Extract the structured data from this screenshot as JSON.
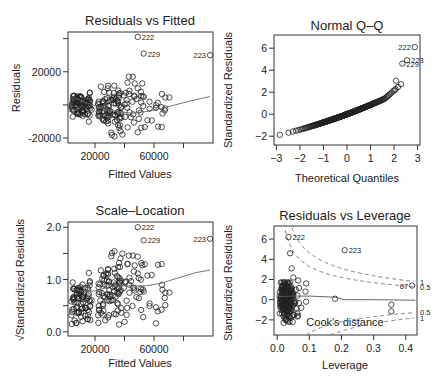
{
  "figure": {
    "caption_fragment": "Figure 6.21: Diagnostic..."
  },
  "chart_data": [
    {
      "id": "p1",
      "type": "scatter",
      "title": "Residuals vs Fitted",
      "xlabel": "Fitted Values",
      "ylabel": "Residuals",
      "xlim": [
        1700,
        100000
      ],
      "ylim": [
        -23000,
        44000
      ],
      "xticks": [
        20000,
        40000,
        60000,
        80000
      ],
      "xtick_labels": [
        "20000",
        "",
        "60000",
        ""
      ],
      "yticks": [
        -20000,
        0,
        20000,
        40000
      ],
      "ytick_labels": [
        "-20000",
        "",
        "20000",
        ""
      ],
      "box": [
        68,
        32,
        213,
        143
      ],
      "labeled_points": [
        {
          "label": "222",
          "x": 49000,
          "y": 41000
        },
        {
          "label": "229",
          "x": 53000,
          "y": 31000
        },
        {
          "label": "223",
          "x": 98000,
          "y": 30000
        }
      ],
      "smooth": [
        [
          4000,
          5000
        ],
        [
          15000,
          1000
        ],
        [
          25000,
          -2000
        ],
        [
          35000,
          -4000
        ],
        [
          45000,
          -5000
        ],
        [
          55000,
          -4000
        ],
        [
          70000,
          -1000
        ],
        [
          85000,
          2500
        ],
        [
          98000,
          5000
        ]
      ],
      "grid": false
    },
    {
      "id": "p2",
      "type": "scatter",
      "title": "Normal Q–Q",
      "xlabel": "Theoretical Quantiles",
      "ylabel": "Standardized Residuals",
      "xlim": [
        -3.1,
        3.1
      ],
      "ylim": [
        -2.8,
        7.2
      ],
      "xticks": [
        -3,
        -2,
        -1,
        0,
        1,
        2,
        3
      ],
      "xtick_labels": [
        "−3",
        "−2",
        "−1",
        "0",
        "1",
        "2",
        "3"
      ],
      "yticks": [
        -2,
        0,
        2,
        4,
        6
      ],
      "ytick_labels": [
        "−2",
        "0",
        "2",
        "4",
        "6"
      ],
      "box": [
        274,
        35,
        420,
        145
      ],
      "labeled_points": [
        {
          "label": "222",
          "x": 2.88,
          "y": 6.1
        },
        {
          "label": "223",
          "x": 2.55,
          "y": 4.9
        },
        {
          "label": "229",
          "x": 2.35,
          "y": 4.6
        }
      ],
      "grid": false
    },
    {
      "id": "p3",
      "type": "scatter",
      "title": "Scale–Location",
      "xlabel": "Fitted Values",
      "ylabel": "√Standardized Residuals",
      "xlim": [
        1700,
        100000
      ],
      "ylim": [
        -0.08,
        2.1
      ],
      "xticks": [
        20000,
        40000,
        60000,
        80000
      ],
      "xtick_labels": [
        "20000",
        "",
        "60000",
        ""
      ],
      "yticks": [
        0.0,
        0.5,
        1.0,
        1.5,
        2.0
      ],
      "ytick_labels": [
        "0.0",
        "",
        "1.0",
        "",
        "2.0"
      ],
      "box": [
        68,
        222,
        213,
        336
      ],
      "labeled_points": [
        {
          "label": "222",
          "x": 49000,
          "y": 2.0
        },
        {
          "label": "229",
          "x": 53000,
          "y": 1.75
        },
        {
          "label": "223",
          "x": 98000,
          "y": 1.78
        }
      ],
      "smooth": [
        [
          3000,
          0.85
        ],
        [
          10000,
          0.78
        ],
        [
          20000,
          0.78
        ],
        [
          30000,
          0.86
        ],
        [
          40000,
          0.88
        ],
        [
          55000,
          0.88
        ],
        [
          65000,
          0.93
        ],
        [
          75000,
          1.02
        ],
        [
          88000,
          1.13
        ],
        [
          98000,
          1.18
        ]
      ],
      "grid": false
    },
    {
      "id": "p4",
      "type": "scatter",
      "title": "Residuals vs Leverage",
      "xlabel": "Leverage",
      "ylabel": "Standardized Residuals",
      "xlim": [
        -0.01,
        0.435
      ],
      "ylim": [
        -3.5,
        7.3
      ],
      "xticks": [
        0.0,
        0.1,
        0.2,
        0.3,
        0.4
      ],
      "xtick_labels": [
        "0.0",
        "0.1",
        "0.2",
        "0.3",
        "0.4"
      ],
      "yticks": [
        -2,
        0,
        2,
        4,
        6
      ],
      "ytick_labels": [
        "−2",
        "0",
        "2",
        "4",
        "6"
      ],
      "box": [
        274,
        226,
        417,
        335
      ],
      "labeled_points": [
        {
          "label": "222",
          "x": 0.035,
          "y": 6.2
        },
        {
          "label": "223",
          "x": 0.21,
          "y": 4.9
        },
        {
          "label": "67",
          "x": 0.42,
          "y": 1.4
        }
      ],
      "extra_points": [
        [
          0.18,
          0.1
        ],
        [
          0.355,
          -0.5
        ],
        [
          0.355,
          -1.15
        ],
        [
          0.04,
          4.6
        ],
        [
          0.045,
          3.1
        ],
        [
          0.05,
          2.2
        ],
        [
          0.065,
          1.9
        ],
        [
          0.09,
          1.6
        ],
        [
          0.088,
          0.8
        ],
        [
          0.09,
          -0.2
        ],
        [
          0.075,
          -0.8
        ],
        [
          0.065,
          -1.6
        ],
        [
          0.03,
          -2.0
        ],
        [
          0.02,
          -2.3
        ]
      ],
      "smooth": [
        [
          0.005,
          0.3
        ],
        [
          0.05,
          0.35
        ],
        [
          0.1,
          0.35
        ],
        [
          0.18,
          0.25
        ],
        [
          0.21,
          0.0
        ],
        [
          0.3,
          0.0
        ],
        [
          0.43,
          -0.05
        ]
      ],
      "cooks_label": "Cook's distance",
      "cooks_levels": [
        "1",
        "0.5",
        "0.5",
        "1"
      ],
      "grid": false
    }
  ]
}
